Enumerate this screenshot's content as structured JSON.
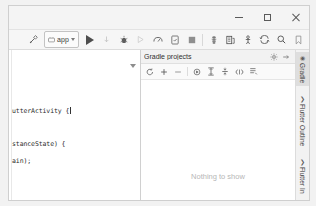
{
  "window": {
    "controls": {
      "minimize": "Minimize",
      "maximize": "Maximize",
      "close": "Close"
    }
  },
  "toolbar": {
    "build_label": "Build",
    "run_config": {
      "name": "app",
      "dropdown": "Select Run/Debug Configuration"
    },
    "run_label": "Run",
    "debug_label": "Debug",
    "items": [
      {
        "name": "build-hammer-icon",
        "label": "Make Project"
      },
      {
        "name": "run-icon",
        "label": "Run 'app'"
      },
      {
        "name": "attach-debugger-icon",
        "label": "Attach Debugger"
      },
      {
        "name": "debug-icon",
        "label": "Debug 'app'"
      },
      {
        "name": "run-coverage-icon",
        "label": "Run with Coverage"
      },
      {
        "name": "profiler-icon",
        "label": "Profile 'app'"
      },
      {
        "name": "apply-changes-icon",
        "label": "Apply Changes"
      },
      {
        "name": "stop-icon",
        "label": "Stop"
      },
      {
        "name": "avd-manager-icon",
        "label": "AVD Manager"
      },
      {
        "name": "sdk-manager-icon",
        "label": "SDK Manager"
      },
      {
        "name": "device-file-explorer-icon",
        "label": "Device File Explorer"
      },
      {
        "name": "sync-project-icon",
        "label": "Sync Project with Gradle Files"
      },
      {
        "name": "search-everywhere-icon",
        "label": "Search Everywhere"
      },
      {
        "name": "bookmark-icon",
        "label": "Bookmarks"
      }
    ]
  },
  "editor": {
    "lines": [
      {
        "text": "utterActivity {",
        "top": 57
      },
      {
        "text": "stanceState) {",
        "top": 90
      },
      {
        "text": "ain);",
        "top": 107
      }
    ],
    "collapse_label": "Collapse"
  },
  "gradle_panel": {
    "title": "Gradle projects",
    "settings_label": "Settings",
    "hide_label": "Hide",
    "empty_text": "Nothing to show",
    "toolbar_buttons": [
      {
        "name": "refresh-icon",
        "label": "Reimport All Gradle Projects"
      },
      {
        "name": "add-icon",
        "label": "Link Gradle Project"
      },
      {
        "name": "remove-icon",
        "label": "Detach External Project"
      },
      {
        "name": "execute-task-icon",
        "label": "Execute Gradle Task"
      },
      {
        "name": "expand-all-icon",
        "label": "Expand All"
      },
      {
        "name": "collapse-all-icon",
        "label": "Collapse All"
      },
      {
        "name": "toggle-offline-icon",
        "label": "Toggle Offline Mode"
      },
      {
        "name": "task-list-icon",
        "label": "Show Task Descriptions"
      }
    ]
  },
  "right_strip": {
    "tabs": [
      {
        "name": "gradle",
        "label": "Gradle",
        "icon": "◉",
        "active": true
      },
      {
        "name": "flutter-outline",
        "label": "Flutter Outline",
        "icon": "❯",
        "active": false
      },
      {
        "name": "flutter-inspector",
        "label": "Flutter In",
        "icon": "❯",
        "active": false
      }
    ]
  },
  "colors": {
    "window_bg": "#f2f2f2",
    "panel_bg": "#ffffff",
    "toolbar_bg": "#f6f6f6",
    "border": "#dcdcdc",
    "muted_text": "#b6b6b6"
  }
}
